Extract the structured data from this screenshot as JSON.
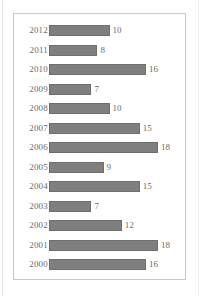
{
  "chart_data": {
    "type": "bar",
    "orientation": "horizontal",
    "title": "",
    "subtitle": "",
    "xlabel": "",
    "ylabel": "",
    "grid": false,
    "legend": null,
    "xlim": [
      0,
      18
    ],
    "categories": [
      "2012",
      "2011",
      "2010",
      "2009",
      "2008",
      "2007",
      "2006",
      "2005",
      "2004",
      "2003",
      "2002",
      "2001",
      "2000"
    ],
    "values": [
      10,
      8,
      16,
      7,
      10,
      15,
      18,
      9,
      15,
      7,
      12,
      18,
      16
    ],
    "data_labels": [
      "10",
      "8",
      "16",
      "7",
      "10",
      "15",
      "18",
      "9",
      "15",
      "7",
      "12",
      "18",
      "16"
    ]
  },
  "style": {
    "bar_fill": "#7f7f7f",
    "bar_border": "#6e6e6e",
    "frame_border": "#c8c8c8",
    "background": "#ffffff",
    "label_color": "#6b6b6b"
  }
}
